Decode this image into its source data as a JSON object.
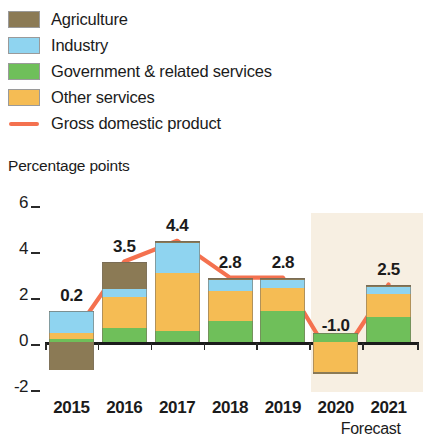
{
  "legend": {
    "items": [
      {
        "label": "Agriculture",
        "color": "#8b7a55",
        "type": "swatch",
        "icon": "legend-swatch-agriculture"
      },
      {
        "label": "Industry",
        "color": "#8fd4f0",
        "type": "swatch",
        "icon": "legend-swatch-industry"
      },
      {
        "label": "Government & related services",
        "color": "#6fbf5a",
        "type": "swatch",
        "icon": "legend-swatch-government"
      },
      {
        "label": "Other services",
        "color": "#f5bc54",
        "type": "swatch",
        "icon": "legend-swatch-other-services"
      },
      {
        "label": "Gross domestic product",
        "color": "#f4714f",
        "type": "line",
        "icon": "legend-line-gdp"
      }
    ]
  },
  "axis_title": "Percentage points",
  "forecast_note": "Forecast",
  "chart_data": {
    "type": "bar",
    "stacked": true,
    "title": "",
    "subtitle": "",
    "xlabel": "",
    "ylabel": "Percentage points",
    "ylim": [
      -2,
      6
    ],
    "yticks": [
      -2,
      0,
      2,
      4,
      6
    ],
    "ytick_labels": [
      "-2",
      "0",
      "2",
      "4",
      "6"
    ],
    "grid": false,
    "legend_position": "top-left",
    "categories": [
      "2015",
      "2016",
      "2017",
      "2018",
      "2019",
      "2020",
      "2021"
    ],
    "forecast_categories": [
      "2020",
      "2021"
    ],
    "series": [
      {
        "name": "Agriculture",
        "color": "#8b7a55",
        "values": [
          -1.2,
          1.2,
          0.1,
          0.1,
          0.1,
          -0.1,
          0.1
        ]
      },
      {
        "name": "Industry",
        "color": "#8fd4f0",
        "values": [
          0.95,
          0.35,
          1.3,
          0.5,
          0.35,
          0.0,
          0.3
        ]
      },
      {
        "name": "Government & related services",
        "color": "#6fbf5a",
        "values": [
          0.15,
          0.6,
          0.5,
          0.9,
          1.35,
          0.4,
          1.1
        ]
      },
      {
        "name": "Other services",
        "color": "#f5bc54",
        "values": [
          0.25,
          1.35,
          2.5,
          1.3,
          1.0,
          -1.3,
          1.0
        ]
      }
    ],
    "line_series": {
      "name": "Gross domestic product",
      "color": "#f4714f",
      "values": [
        0.2,
        3.5,
        4.4,
        2.8,
        2.8,
        -1.0,
        2.5
      ],
      "labels": [
        "0.2",
        "3.5",
        "4.4",
        "2.8",
        "2.8",
        "-1.0",
        "2.5"
      ]
    }
  }
}
